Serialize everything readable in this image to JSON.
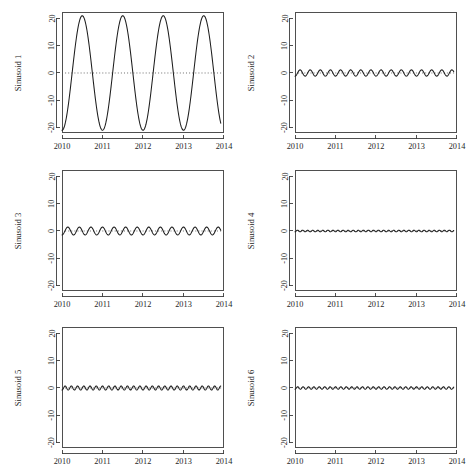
{
  "figure": {
    "title": "",
    "layout": "2 columns x 3 rows",
    "background_color": "#ffffff",
    "line_color": "#1d1d1d",
    "axis_color": "#3b3b3b"
  },
  "chart_data": [
    {
      "type": "line",
      "title": "",
      "xlabel": "",
      "ylabel": "Sinusoid 1",
      "xlim": [
        2010,
        2014
      ],
      "ylim": [
        -22,
        22
      ],
      "xticks": [
        2010,
        2011,
        2012,
        2013,
        2014
      ],
      "xticklabels": [
        "2010",
        "2011",
        "2012",
        "2013",
        "2014"
      ],
      "yticks": [
        -20,
        -10,
        0,
        10,
        20
      ],
      "yticklabels": [
        "-20",
        "-10",
        "0",
        "10",
        "20"
      ],
      "grid": false,
      "legend": "none",
      "reference_line_y": 0,
      "reference_line_style": "dotted",
      "series": [
        {
          "name": "Sinusoid 1",
          "amplitude": 21,
          "cycles_per_year": 1,
          "phase_deg": -90,
          "x_start": 2010,
          "x_end": 2013.92,
          "samples": 420
        }
      ]
    },
    {
      "type": "line",
      "title": "",
      "xlabel": "",
      "ylabel": "Sinusoid 2",
      "xlim": [
        2010,
        2014
      ],
      "ylim": [
        -22,
        22
      ],
      "xticks": [
        2010,
        2011,
        2012,
        2013,
        2014
      ],
      "xticklabels": [
        "2010",
        "2011",
        "2012",
        "2013",
        "2014"
      ],
      "yticks": [
        -20,
        -10,
        0,
        10,
        20
      ],
      "yticklabels": [
        "-20",
        "-10",
        "0",
        "10",
        "20"
      ],
      "grid": false,
      "legend": "none",
      "reference_line_y": 0,
      "reference_line_style": "dotted",
      "series": [
        {
          "name": "Sinusoid 2",
          "amplitude": 1.15,
          "cycles_per_year": 4,
          "phase_deg": -90,
          "x_start": 2010,
          "x_end": 2013.92,
          "samples": 420
        }
      ]
    },
    {
      "type": "line",
      "title": "",
      "xlabel": "",
      "ylabel": "Sinusoid 3",
      "xlim": [
        2010,
        2014
      ],
      "ylim": [
        -22,
        22
      ],
      "xticks": [
        2010,
        2011,
        2012,
        2013,
        2014
      ],
      "xticklabels": [
        "2010",
        "2011",
        "2012",
        "2013",
        "2014"
      ],
      "yticks": [
        -20,
        -10,
        0,
        10,
        20
      ],
      "yticklabels": [
        "-20",
        "-10",
        "0",
        "10",
        "20"
      ],
      "grid": false,
      "legend": "none",
      "reference_line_y": 0,
      "reference_line_style": "dotted",
      "series": [
        {
          "name": "Sinusoid 3",
          "amplitude": 1.45,
          "cycles_per_year": 3.5,
          "phase_deg": -90,
          "x_start": 2010,
          "x_end": 2013.92,
          "samples": 420
        }
      ]
    },
    {
      "type": "line",
      "title": "",
      "xlabel": "",
      "ylabel": "Sinusoid 4",
      "xlim": [
        2010,
        2014
      ],
      "ylim": [
        -22,
        22
      ],
      "xticks": [
        2010,
        2011,
        2012,
        2013,
        2014
      ],
      "xticklabels": [
        "2010",
        "2011",
        "2012",
        "2013",
        "2014"
      ],
      "yticks": [
        -20,
        -10,
        0,
        10,
        20
      ],
      "yticklabels": [
        "-20",
        "-10",
        "0",
        "10",
        "20"
      ],
      "grid": false,
      "legend": "none",
      "reference_line_y": 0,
      "reference_line_style": "dotted",
      "series": [
        {
          "name": "Sinusoid 4",
          "amplitude": 0.3,
          "cycles_per_year": 8,
          "phase_deg": -90,
          "x_start": 2010,
          "x_end": 2013.92,
          "samples": 600
        }
      ]
    },
    {
      "type": "line",
      "title": "",
      "xlabel": "",
      "ylabel": "Sinusoid 5",
      "xlim": [
        2010,
        2014
      ],
      "ylim": [
        -22,
        22
      ],
      "xticks": [
        2010,
        2011,
        2012,
        2013,
        2014
      ],
      "xticklabels": [
        "2010",
        "2011",
        "2012",
        "2013",
        "2014"
      ],
      "yticks": [
        -20,
        -10,
        0,
        10,
        20
      ],
      "yticklabels": [
        "-20",
        "-10",
        "0",
        "10",
        "20"
      ],
      "grid": false,
      "legend": "none",
      "reference_line_y": 0,
      "reference_line_style": "dotted",
      "series": [
        {
          "name": "Sinusoid 5",
          "amplitude": 0.75,
          "cycles_per_year": 6.5,
          "phase_deg": -90,
          "x_start": 2010,
          "x_end": 2013.92,
          "samples": 600
        }
      ]
    },
    {
      "type": "line",
      "title": "",
      "xlabel": "",
      "ylabel": "Sinusoid 6",
      "xlim": [
        2010,
        2014
      ],
      "ylim": [
        -22,
        22
      ],
      "xticks": [
        2010,
        2011,
        2012,
        2013,
        2014
      ],
      "xticklabels": [
        "2010",
        "2011",
        "2012",
        "2013",
        "2014"
      ],
      "yticks": [
        -20,
        -10,
        0,
        10,
        20
      ],
      "yticklabels": [
        "-20",
        "-10",
        "0",
        "10",
        "20"
      ],
      "grid": false,
      "legend": "none",
      "reference_line_y": 0,
      "reference_line_style": "dotted",
      "series": [
        {
          "name": "Sinusoid 6",
          "amplitude": 0.45,
          "cycles_per_year": 7.5,
          "phase_deg": -90,
          "x_start": 2010,
          "x_end": 2013.92,
          "samples": 600
        }
      ]
    }
  ]
}
